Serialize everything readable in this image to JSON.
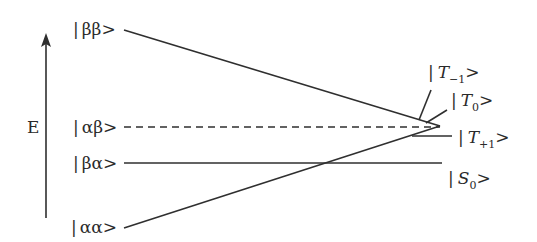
{
  "diagram": {
    "axis": {
      "label": "E",
      "direction": "up"
    },
    "states": {
      "bb": {
        "label": "|ββ>",
        "bar": "|",
        "text": "ββ>"
      },
      "ab": {
        "label": "|αβ>",
        "bar": "|",
        "text": "αβ>"
      },
      "ba": {
        "label": "|βα>",
        "bar": "|",
        "text": "βα>"
      },
      "aa": {
        "label": "|αα>",
        "bar": "|",
        "text": "αα>"
      }
    },
    "mixed_states": {
      "t_minus": {
        "label": "|T₋₁>",
        "bar": "|",
        "base": "T",
        "sub": "−1",
        "close": ">"
      },
      "t_zero": {
        "label": "|T₀>",
        "bar": "|",
        "base": "T",
        "sub": "0",
        "close": ">"
      },
      "t_plus": {
        "label": "|T₊₁>",
        "bar": "|",
        "base": "T",
        "sub": "+1",
        "close": ">"
      },
      "s_zero": {
        "label": "|S₀>",
        "bar": "|",
        "base": "S",
        "sub": "0",
        "close": ">"
      }
    },
    "connections": [
      {
        "from": "|ββ>",
        "to": "convergence",
        "style": "solid"
      },
      {
        "from": "|αβ>",
        "to": "convergence",
        "style": "dashed"
      },
      {
        "from": "|αα>",
        "to": "convergence",
        "style": "solid"
      },
      {
        "from": "|βα>",
        "to": "|S₀>",
        "style": "solid"
      }
    ],
    "line_color": "#2f2f2f"
  }
}
